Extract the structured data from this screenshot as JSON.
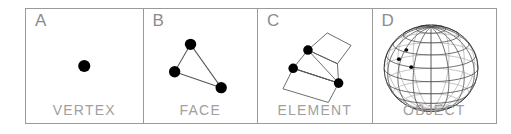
{
  "figure": {
    "panel_count": 4,
    "border_color": "#9a9a9a",
    "background": "#ffffff",
    "label_color": "#a0a0a0",
    "letter_color": "#8c8c8c",
    "ink_color": "#000000",
    "line_color": "#555555"
  },
  "panels": [
    {
      "letter": "A",
      "label": "VERTEX",
      "graphic": "single-filled-dot",
      "dots": [
        {
          "cx": 50,
          "cy": 50,
          "r": 5.2
        }
      ],
      "edges": []
    },
    {
      "letter": "B",
      "label": "FACE",
      "graphic": "triangle-with-three-vertices",
      "dots": [
        {
          "cx": 41,
          "cy": 31,
          "r": 5.0
        },
        {
          "cx": 27,
          "cy": 55,
          "r": 5.0
        },
        {
          "cx": 68,
          "cy": 69,
          "r": 5.0
        }
      ],
      "edges": [
        {
          "x1": 41,
          "y1": 31,
          "x2": 27,
          "y2": 55
        },
        {
          "x1": 27,
          "y1": 55,
          "x2": 68,
          "y2": 69
        },
        {
          "x1": 68,
          "y1": 69,
          "x2": 41,
          "y2": 31
        }
      ]
    },
    {
      "letter": "C",
      "label": "ELEMENT",
      "graphic": "quad-strip-mesh-patch",
      "dots": [
        {
          "cx": 44,
          "cy": 36,
          "r": 4.2
        },
        {
          "cx": 31,
          "cy": 52,
          "r": 4.2
        },
        {
          "cx": 71,
          "cy": 65,
          "r": 4.2
        }
      ],
      "quads": [
        [
          [
            44,
            36
          ],
          [
            61,
            21
          ],
          [
            82,
            32
          ],
          [
            70,
            48
          ]
        ],
        [
          [
            44,
            36
          ],
          [
            70,
            48
          ],
          [
            71,
            65
          ],
          [
            31,
            52
          ]
        ],
        [
          [
            31,
            52
          ],
          [
            71,
            65
          ],
          [
            62,
            82
          ],
          [
            22,
            70
          ]
        ]
      ],
      "edges": [
        {
          "x1": 44,
          "y1": 36,
          "x2": 71,
          "y2": 65
        },
        {
          "x1": 31,
          "y1": 52,
          "x2": 71,
          "y2": 65
        },
        {
          "x1": 44,
          "y1": 36,
          "x2": 31,
          "y2": 52
        }
      ]
    },
    {
      "letter": "D",
      "label": "OBJECT",
      "graphic": "wireframe-sphere-globe",
      "sphere": {
        "cx": 47,
        "cy": 52,
        "rx": 38,
        "ry": 38,
        "meridians": 16,
        "parallels": 9,
        "tilt_degrees": 18
      },
      "dots": [
        {
          "cx": 27,
          "cy": 36,
          "r": 1.6
        },
        {
          "cx": 21,
          "cy": 44,
          "r": 1.6
        },
        {
          "cx": 31,
          "cy": 51,
          "r": 1.6
        }
      ]
    }
  ]
}
